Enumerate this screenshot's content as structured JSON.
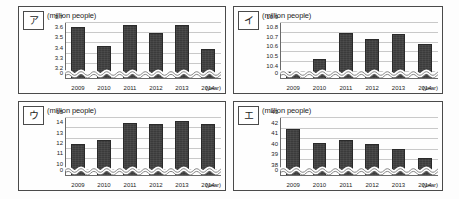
{
  "page": {
    "background": "#fdfdfd",
    "bar_color": "#3b3b3b",
    "grid_color": "#c9c9c9",
    "axis_color": "#6a6a6a"
  },
  "panels": [
    {
      "tag": "ア",
      "unit_label": "(million people)",
      "xaxis_title": "(year)",
      "chart_data": {
        "type": "bar",
        "title": "",
        "xlabel": "(year)",
        "ylabel": "(million people)",
        "categories": [
          "2009",
          "2010",
          "2011",
          "2012",
          "2013",
          "2014"
        ],
        "values": [
          3.66,
          3.47,
          3.68,
          3.6,
          3.68,
          3.44
        ],
        "yticks": [
          "0",
          "3.2",
          "3.3",
          "3.4",
          "3.5",
          "3.6",
          "3.7"
        ],
        "ytick_values": [
          0,
          3.2,
          3.3,
          3.4,
          3.5,
          3.6,
          3.7
        ],
        "ylim": [
          3.15,
          3.7
        ],
        "axis_break": true,
        "grid": true,
        "legend": "none"
      }
    },
    {
      "tag": "イ",
      "unit_label": "(million people)",
      "xaxis_title": "(year)",
      "chart_data": {
        "type": "bar",
        "title": "",
        "xlabel": "(year)",
        "ylabel": "(million people)",
        "categories": [
          "2009",
          "2010",
          "2011",
          "2012",
          "2013",
          "2014"
        ],
        "values": [
          10.4,
          10.53,
          10.8,
          10.74,
          10.79,
          10.69
        ],
        "yticks": [
          "0",
          "10.4",
          "10.5",
          "10.6",
          "10.7",
          "10.8",
          "10.9"
        ],
        "ytick_values": [
          0,
          10.4,
          10.5,
          10.6,
          10.7,
          10.8,
          10.9
        ],
        "ylim": [
          10.33,
          10.9
        ],
        "axis_break": true,
        "grid": true,
        "legend": "none"
      }
    },
    {
      "tag": "ウ",
      "unit_label": "(million people)",
      "xaxis_title": "(year)",
      "chart_data": {
        "type": "bar",
        "title": "",
        "xlabel": "(year)",
        "ylabel": "(million people)",
        "categories": [
          "2009",
          "2010",
          "2011",
          "2012",
          "2013",
          "2014"
        ],
        "values": [
          12.5,
          12.9,
          14.55,
          14.45,
          14.75,
          14.4
        ],
        "yticks": [
          "0",
          "10",
          "11",
          "12",
          "13",
          "14",
          "15"
        ],
        "ytick_values": [
          0,
          10,
          11,
          12,
          13,
          14,
          15
        ],
        "ylim": [
          9.4,
          15
        ],
        "axis_break": true,
        "grid": true,
        "legend": "none"
      }
    },
    {
      "tag": "エ",
      "unit_label": "(million people)",
      "xaxis_title": "(year)",
      "chart_data": {
        "type": "bar",
        "title": "",
        "xlabel": "(year)",
        "ylabel": "(million people)",
        "categories": [
          "2009",
          "2010",
          "2011",
          "2012",
          "2013",
          "2014"
        ],
        "values": [
          42.0,
          40.6,
          40.9,
          40.5,
          40.1,
          39.2
        ],
        "yticks": [
          "0",
          "38",
          "39",
          "40",
          "41",
          "42",
          "43"
        ],
        "ytick_values": [
          0,
          38,
          39,
          40,
          41,
          42,
          43
        ],
        "ylim": [
          37.5,
          43
        ],
        "axis_break": true,
        "grid": true,
        "legend": "none"
      }
    }
  ]
}
